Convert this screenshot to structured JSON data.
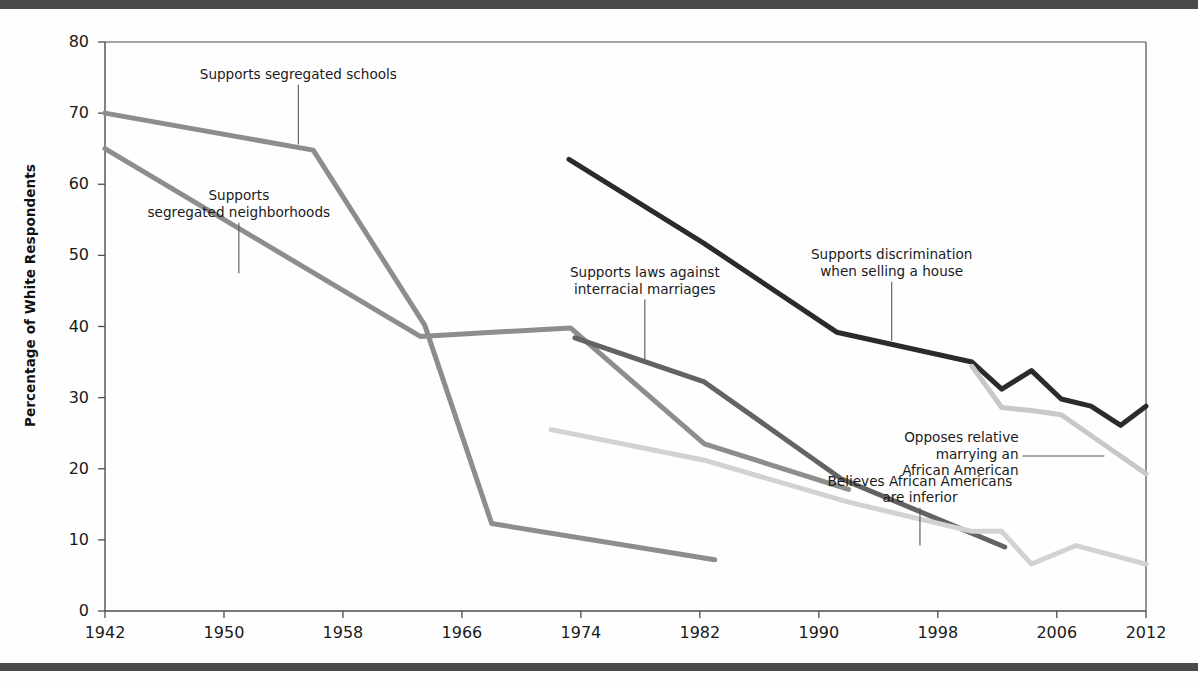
{
  "figure": {
    "y_axis_title": "Percentage of White Respondents",
    "top_rule_color": "#4a4a4a",
    "bottom_rule_color": "#4a4a4a"
  },
  "chart_data": {
    "type": "line",
    "title": "",
    "xlabel": "",
    "ylabel": "Percentage of White Respondents",
    "xlim": [
      1942,
      2012
    ],
    "ylim": [
      0,
      80
    ],
    "xticks": [
      1942,
      1950,
      1958,
      1966,
      1974,
      1982,
      1990,
      1998,
      2006,
      2012
    ],
    "yticks": [
      0,
      10,
      20,
      30,
      40,
      50,
      60,
      70,
      80
    ],
    "grid": false,
    "legend": "annotations-inline",
    "series": [
      {
        "name": "Supports segregated schools",
        "color": "#8d8d8d",
        "width": 5,
        "points": [
          [
            1942,
            70
          ],
          [
            1956,
            64.8
          ],
          [
            1963.5,
            40.2
          ],
          [
            1968,
            12.3
          ],
          [
            1983,
            7.2
          ]
        ]
      },
      {
        "name": "Supports segregated neighborhoods",
        "color": "#8d8d8d",
        "width": 5,
        "points": [
          [
            1942,
            65
          ],
          [
            1963.2,
            38.6
          ],
          [
            1973.3,
            39.8
          ],
          [
            1982.3,
            23.5
          ],
          [
            1992,
            17.1
          ]
        ]
      },
      {
        "name": "Supports laws against interracial marriages",
        "color": "#636363",
        "width": 5,
        "points": [
          [
            1973.6,
            38.4
          ],
          [
            1982.3,
            32.2
          ],
          [
            1991.5,
            18.6
          ],
          [
            2002.5,
            9
          ]
        ]
      },
      {
        "name": "Supports discrimination when selling a house",
        "color": "#2b2b2b",
        "width": 5,
        "points": [
          [
            1973.2,
            63.5
          ],
          [
            1982.2,
            51.8
          ],
          [
            1991.2,
            39.2
          ],
          [
            2000.3,
            35
          ],
          [
            2002.3,
            31.2
          ],
          [
            2004.3,
            33.8
          ],
          [
            2006.3,
            29.8
          ],
          [
            2008.3,
            28.8
          ],
          [
            2010.3,
            26.1
          ],
          [
            2012,
            28.8
          ]
        ]
      },
      {
        "name": "Believes African Americans are inferior",
        "color": "#d2d2d2",
        "width": 5,
        "points": [
          [
            1972,
            25.5
          ],
          [
            1982.3,
            21.2
          ],
          [
            1992,
            15.3
          ],
          [
            2000.3,
            11.2
          ],
          [
            2002.3,
            11.2
          ],
          [
            2004.3,
            6.6
          ],
          [
            2007.3,
            9.2
          ],
          [
            2012,
            6.6
          ]
        ]
      },
      {
        "name": "Opposes relative marrying an African American",
        "color": "#c8c8c8",
        "width": 5,
        "points": [
          [
            2000.3,
            34.4
          ],
          [
            2002.3,
            28.6
          ],
          [
            2004.3,
            28.2
          ],
          [
            2006.3,
            27.6
          ],
          [
            2012,
            19.3
          ]
        ]
      }
    ],
    "annotations": [
      {
        "id": "supports-segregated-schools",
        "lines": [
          "Supports segregated schools"
        ],
        "align": "center",
        "leader": {
          "x1": 1955.0,
          "y1": 74.0,
          "x2": 1955.0,
          "y2": 65.6
        }
      },
      {
        "id": "supports-segregated-neighborhoods",
        "lines": [
          "Supports",
          "segregated neighborhoods"
        ],
        "align": "center",
        "leader": {
          "x1": 1951.0,
          "y1": 54.6,
          "x2": 1951.0,
          "y2": 47.5
        }
      },
      {
        "id": "supports-laws-against-interracial-marriages",
        "lines": [
          "Supports laws against",
          "interracial marriages"
        ],
        "align": "center",
        "leader": {
          "x1": 1978.3,
          "y1": 43.8,
          "x2": 1978.3,
          "y2": 35.2
        }
      },
      {
        "id": "supports-discrimination-when-selling-a-house",
        "lines": [
          "Supports discrimination",
          "when selling a house"
        ],
        "align": "center",
        "leader": {
          "x1": 1994.9,
          "y1": 46.3,
          "x2": 1994.9,
          "y2": 38.0
        }
      },
      {
        "id": "believes-african-americans-are-inferior",
        "lines": [
          "Believes African Americans",
          "are inferior"
        ],
        "align": "center",
        "leader": {
          "x1": 1996.8,
          "y1": 14.5,
          "x2": 1996.8,
          "y2": 9.2
        }
      },
      {
        "id": "opposes-relative-marrying-an-african-american",
        "lines": [
          "Opposes relative",
          "marrying an",
          "African American"
        ],
        "align": "right",
        "leader": {
          "x1": 2003.7,
          "y1": 21.8,
          "x2": 2009.2,
          "y2": 21.8
        }
      }
    ]
  },
  "annotation_text": {
    "supports_segregated_schools": "Supports segregated schools",
    "supports_segregated_neighborhoods_l1": "Supports",
    "supports_segregated_neighborhoods_l2": "segregated neighborhoods",
    "interracial_l1": "Supports laws against",
    "interracial_l2": "interracial marriages",
    "discrimination_l1": "Supports discrimination",
    "discrimination_l2": "when selling a house",
    "inferior_l1": "Believes African Americans",
    "inferior_l2": "are inferior",
    "opposes_l1": "Opposes relative",
    "opposes_l2": "marrying an",
    "opposes_l3": "African American"
  }
}
